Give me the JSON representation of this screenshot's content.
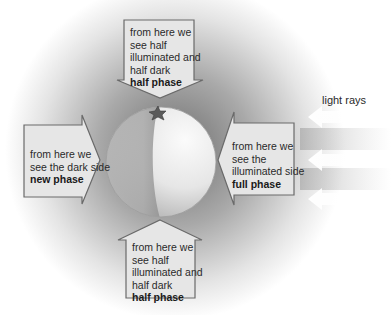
{
  "diagram": {
    "light_label": "light rays",
    "viewpoints": [
      {
        "id": "top",
        "lines": [
          "from here we",
          "see half",
          "illuminated and",
          "half dark"
        ],
        "phase": "half phase"
      },
      {
        "id": "left",
        "lines": [
          "from here we",
          "see the dark side"
        ],
        "phase": "new phase"
      },
      {
        "id": "right",
        "lines": [
          "from here we",
          "see the",
          "illuminated side"
        ],
        "phase": "full phase"
      },
      {
        "id": "bottom",
        "lines": [
          "from here we",
          "see half",
          "illuminated and",
          "half dark"
        ],
        "phase": "half phase"
      }
    ],
    "colors": {
      "arrow_fill": "#e6e6e6",
      "arrow_stroke": "#6a6a6a",
      "shadow": "#7a7a7a",
      "sphere_light": "#f2f2f2",
      "sphere_dark": "#9a9a9a",
      "text": "#2a2a2a"
    }
  }
}
